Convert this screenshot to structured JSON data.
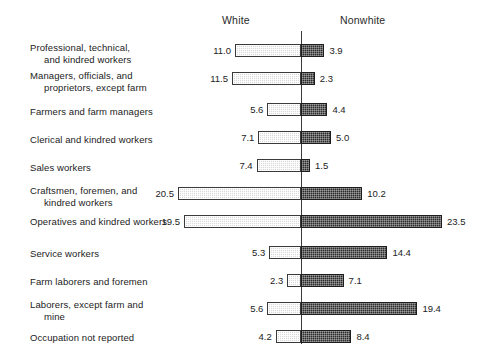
{
  "header": {
    "left_label": "White",
    "right_label": "Nonwhite"
  },
  "chart_data": {
    "type": "bar",
    "orientation": "horizontal-diverging",
    "title": "",
    "subtitle": "",
    "xlabel": "",
    "ylabel": "",
    "grid": false,
    "legend_position": "top",
    "axis_center_value": 0,
    "units": "percent",
    "categories": [
      "Professional, technical, and kindred workers",
      "Managers, officials, and proprietors, except farm",
      "Farmers and farm managers",
      "Clerical and kindred workers",
      "Sales workers",
      "Craftsmen, foremen, and kindred workers",
      "Operatives and kindred workers",
      "Service workers",
      "Farm laborers and foremen",
      "Laborers, except farm and mine",
      "Occupation not reported"
    ],
    "series": [
      {
        "name": "White",
        "side": "left",
        "color": "#d9d9d9",
        "values": [
          11.0,
          11.5,
          5.6,
          7.1,
          7.4,
          20.5,
          19.5,
          5.3,
          2.3,
          5.6,
          4.2
        ]
      },
      {
        "name": "Nonwhite",
        "side": "right",
        "color": "#2b2b2b",
        "values": [
          3.9,
          2.3,
          4.4,
          5.0,
          1.5,
          10.2,
          23.5,
          14.4,
          7.1,
          19.4,
          8.4
        ]
      }
    ],
    "xlim": [
      0,
      24
    ],
    "px_per_unit": 6.0
  },
  "rows": [
    {
      "label_line1": "Professional, technical,",
      "label_line2": "and kindred workers",
      "left_value": "11.0",
      "right_value": "3.9",
      "left_num": 11.0,
      "right_num": 3.9
    },
    {
      "label_line1": "Managers, officials, and",
      "label_line2": "proprietors, except farm",
      "left_value": "11.5",
      "right_value": "2.3",
      "left_num": 11.5,
      "right_num": 2.3
    },
    {
      "label_line1": "Farmers and farm managers",
      "label_line2": "",
      "left_value": "5.6",
      "right_value": "4.4",
      "left_num": 5.6,
      "right_num": 4.4
    },
    {
      "label_line1": "Clerical and kindred workers",
      "label_line2": "",
      "left_value": "7.1",
      "right_value": "5.0",
      "left_num": 7.1,
      "right_num": 5.0
    },
    {
      "label_line1": "Sales workers",
      "label_line2": "",
      "left_value": "7.4",
      "right_value": "1.5",
      "left_num": 7.4,
      "right_num": 1.5
    },
    {
      "label_line1": "Craftsmen, foremen, and",
      "label_line2": "kindred workers",
      "left_value": "20.5",
      "right_value": "10.2",
      "left_num": 20.5,
      "right_num": 10.2
    },
    {
      "label_line1": "Operatives and kindred workers",
      "label_line2": "",
      "left_value": "19.5",
      "right_value": "23.5",
      "left_num": 19.5,
      "right_num": 23.5
    },
    {
      "label_line1": "Service workers",
      "label_line2": "",
      "left_value": "5.3",
      "right_value": "14.4",
      "left_num": 5.3,
      "right_num": 14.4
    },
    {
      "label_line1": "Farm laborers and foremen",
      "label_line2": "",
      "left_value": "2.3",
      "right_value": "7.1",
      "left_num": 2.3,
      "right_num": 7.1
    },
    {
      "label_line1": "Laborers, except farm and",
      "label_line2": "mine",
      "left_value": "5.6",
      "right_value": "19.4",
      "left_num": 5.6,
      "right_num": 19.4
    },
    {
      "label_line1": "Occupation not reported",
      "label_line2": "",
      "left_value": "4.2",
      "right_value": "8.4",
      "left_num": 4.2,
      "right_num": 8.4
    }
  ],
  "layout": {
    "axis_x": 301,
    "px_per_unit": 6.0,
    "row_tops": [
      44,
      72,
      103,
      131,
      159,
      187,
      215,
      246,
      274,
      302,
      330
    ],
    "label_tops": [
      42,
      70,
      106,
      134,
      162,
      185,
      216,
      248,
      276,
      299,
      332
    ],
    "bar_height": 13
  }
}
